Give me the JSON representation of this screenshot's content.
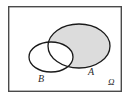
{
  "figure": {
    "type": "venn-diagram",
    "title": "",
    "shaded_region_meaning": "A minus B",
    "background_color": "#ffffff",
    "frame": {
      "name": "sample-space-rectangle",
      "stroke_color": "#4a4a4a",
      "fill_color": "#ffffff",
      "stroke_width": 1.4,
      "x": 8,
      "y": 6,
      "width": 114,
      "height": 86
    },
    "sets": [
      {
        "id": "A",
        "label": "A",
        "shape": "ellipse",
        "cx": 79,
        "cy": 46,
        "rx": 31,
        "ry": 22,
        "fill_color": "#dcdcdc",
        "stroke_color": "#1a1a1a",
        "stroke_width": 1.3,
        "shaded": true
      },
      {
        "id": "B",
        "label": "B",
        "shape": "ellipse",
        "cx": 51,
        "cy": 57,
        "rx": 22,
        "ry": 15,
        "fill_color": "#ffffff",
        "stroke_color": "#1a1a1a",
        "stroke_width": 1.3,
        "shaded": false
      }
    ],
    "labels": {
      "set_a": "A",
      "set_b": "B",
      "sample_space": "Ω"
    }
  }
}
